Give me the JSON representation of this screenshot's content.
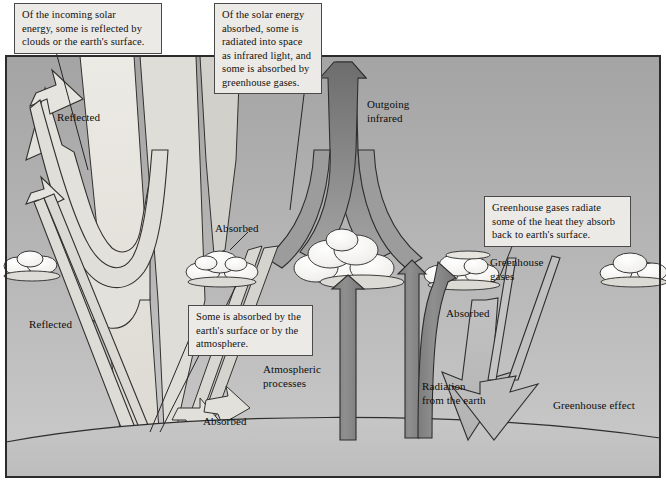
{
  "figure": {
    "frame": {
      "border_color": "#2b2b2b",
      "background_top": "#a9a9a9",
      "background_bottom": "#c9c9c9"
    }
  },
  "callouts": [
    {
      "id": "incoming-solar",
      "text": "Of the incoming solar\nenergy, some is reflected by\nclouds or the earth's surface."
    },
    {
      "id": "solar-absorbed",
      "text": "Of the solar energy\nabsorbed, some is\nradiated into space\nas infrared light, and\nsome is absorbed by\ngreenhouse gases."
    },
    {
      "id": "surface-absorption",
      "text": "Some is absorbed by the\nearth's surface or by the\natmosphere."
    },
    {
      "id": "greenhouse-radiate",
      "text": "Greenhouse gases radiate\nsome of the heat they absorb\nback to earth's surface."
    }
  ],
  "labels": [
    {
      "id": "reflected-upper",
      "text": "Reflected"
    },
    {
      "id": "reflected-lower",
      "text": "Reflected"
    },
    {
      "id": "absorbed-cloud-left",
      "text": "Absorbed"
    },
    {
      "id": "absorbed-surface",
      "text": "Absorbed"
    },
    {
      "id": "absorbed-cloud-right",
      "text": "Absorbed"
    },
    {
      "id": "outgoing-infrared",
      "text": "Outgoing\ninfrared"
    },
    {
      "id": "atmospheric-processes",
      "text": "Atmospheric\nprocesses"
    },
    {
      "id": "radiation-from-earth",
      "text": "Radiation\nfrom the earth"
    },
    {
      "id": "greenhouse-gases",
      "text": "Greenhouse\ngases"
    },
    {
      "id": "greenhouse-effect",
      "text": "Greenhouse effect"
    }
  ],
  "colors": {
    "sky_top": "#a6a6a6",
    "sky_bottom": "#c8c8c8",
    "earth_fill": "#c0c0c0",
    "solar_beam": "#e2e0da",
    "reflected_arrow": "#dedcd6",
    "infrared_dark": "#8c8c8c",
    "arrow_dark": "#8a8a8a",
    "cloud_fill": "#f4f3f0",
    "outline": "#2a2a2a",
    "callout_bg": "#eceae6"
  }
}
